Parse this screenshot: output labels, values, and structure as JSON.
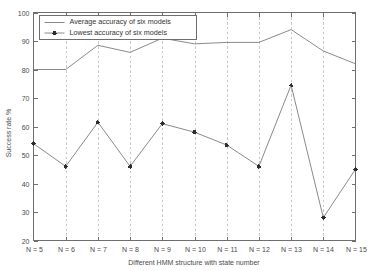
{
  "chart_data": {
    "type": "line",
    "title": "",
    "xlabel": "Different HMM structure with state number",
    "ylabel": "Success rate %",
    "categories": [
      "N = 5",
      "N = 6",
      "N = 7",
      "N = 8",
      "N = 9",
      "N = 10",
      "N = 11",
      "N = 12",
      "N = 13",
      "N = 14",
      "N = 15"
    ],
    "x_values": [
      5,
      6,
      7,
      8,
      9,
      10,
      11,
      12,
      13,
      14,
      15
    ],
    "ylim": [
      20,
      100
    ],
    "xlim": [
      5,
      15
    ],
    "y_ticks": [
      20,
      30,
      40,
      50,
      60,
      70,
      80,
      90,
      100
    ],
    "y_tick_labels": [
      "20",
      "30",
      "40",
      "50",
      "60",
      "70",
      "80",
      "90",
      "100"
    ],
    "grid": "vertical dashed gridlines at each state number",
    "legend_position": "top-left inside axes",
    "series": [
      {
        "name": "Average accuracy of six models",
        "marker": "none",
        "values": [
          80.0,
          80.0,
          88.5,
          86.0,
          91.0,
          89.0,
          89.5,
          89.5,
          94.0,
          86.5,
          82.0
        ]
      },
      {
        "name": "Lowest accuracy of six models",
        "marker": "plus",
        "values": [
          54.0,
          46.0,
          61.5,
          46.0,
          61.0,
          58.0,
          53.5,
          46.0,
          74.5,
          28.0,
          45.0
        ]
      }
    ]
  },
  "legend": {
    "entries": [
      {
        "label": "Average accuracy of six models"
      },
      {
        "label": "Lowest accuracy of six models"
      }
    ]
  },
  "axes": {
    "y_label": "Success rate %",
    "x_label": "Different HMM structure with state number"
  },
  "colors": {
    "background": "#ffffff",
    "axis": "#6e6e6e",
    "grid": "#c9c9c9",
    "line": "#7d7d7d",
    "marker": "#2e2e2e",
    "text": "#4a4a4a"
  }
}
